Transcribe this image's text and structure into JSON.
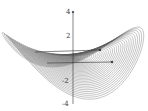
{
  "chart_data": {
    "type": "surface",
    "title": "",
    "function": "z = x^2 - y^2",
    "zlabel": "",
    "xlabel": "",
    "ylabel": "",
    "z_ticks": [
      "4",
      "2",
      "-2",
      "-4"
    ],
    "zlim": [
      -4,
      4
    ],
    "grid": false,
    "legend": null,
    "colors": {
      "surface": "#555555",
      "axis": "#333333",
      "background": "#ffffff"
    }
  }
}
